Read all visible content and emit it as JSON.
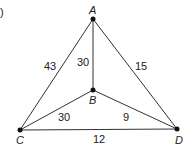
{
  "figure": {
    "marker": ")",
    "nodes": [
      {
        "id": "A",
        "label": "A",
        "x": 93,
        "y": 19
      },
      {
        "id": "B",
        "label": "B",
        "x": 93,
        "y": 90
      },
      {
        "id": "C",
        "label": "C",
        "x": 20,
        "y": 130
      },
      {
        "id": "D",
        "label": "D",
        "x": 177,
        "y": 129
      }
    ],
    "edges": [
      {
        "from": "A",
        "to": "C",
        "weight": "43"
      },
      {
        "from": "A",
        "to": "B",
        "weight": "30"
      },
      {
        "from": "A",
        "to": "D",
        "weight": "15"
      },
      {
        "from": "B",
        "to": "C",
        "weight": "30"
      },
      {
        "from": "B",
        "to": "D",
        "weight": "9"
      },
      {
        "from": "C",
        "to": "D",
        "weight": "12"
      }
    ]
  }
}
